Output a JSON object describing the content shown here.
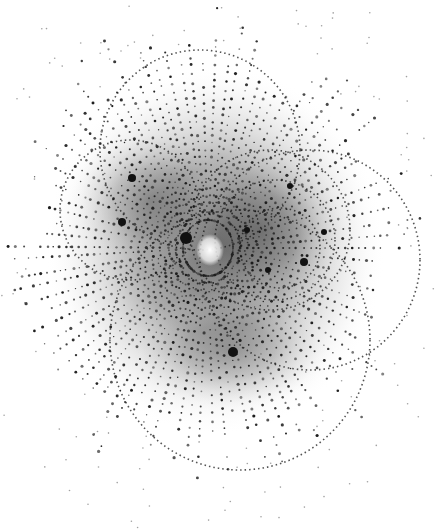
{
  "image": {
    "subject": "Laue X-ray diffraction pattern",
    "width": 436,
    "height": 530,
    "background": "#ffffff",
    "spot_color": "#1a1a1a",
    "halo_color": "#5a5a5a",
    "center": {
      "x": 208,
      "y": 248
    },
    "beamstop_center": {
      "x": 210,
      "y": 248
    },
    "bright_spots": [
      {
        "x": 186,
        "y": 238,
        "r": 6
      },
      {
        "x": 132,
        "y": 178,
        "r": 4
      },
      {
        "x": 122,
        "y": 222,
        "r": 4
      },
      {
        "x": 290,
        "y": 186,
        "r": 3
      },
      {
        "x": 233,
        "y": 352,
        "r": 5
      },
      {
        "x": 304,
        "y": 262,
        "r": 4
      },
      {
        "x": 268,
        "y": 270,
        "r": 3
      },
      {
        "x": 247,
        "y": 230,
        "r": 3
      },
      {
        "x": 324,
        "y": 232,
        "r": 3
      }
    ],
    "arcs": [
      {
        "cx": 270,
        "cy": 230,
        "r": 80
      },
      {
        "cx": 275,
        "cy": 240,
        "r": 60
      },
      {
        "cx": 280,
        "cy": 248,
        "r": 40
      },
      {
        "cx": 240,
        "cy": 340,
        "r": 130
      },
      {
        "cx": 130,
        "cy": 210,
        "r": 70
      },
      {
        "cx": 200,
        "cy": 150,
        "r": 100
      },
      {
        "cx": 310,
        "cy": 260,
        "r": 110
      }
    ]
  }
}
